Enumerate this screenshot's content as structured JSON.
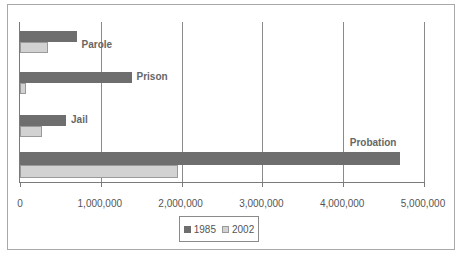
{
  "chart_data": {
    "type": "bar",
    "orientation": "horizontal",
    "title": "",
    "xlabel": "",
    "ylabel": "",
    "categories": [
      "Parole",
      "Prison",
      "Jail",
      "Probation"
    ],
    "series": [
      {
        "name": "1985",
        "color": "#6e6e6e",
        "values": [
          700000,
          1380000,
          570000,
          4700000
        ]
      },
      {
        "name": "2002",
        "color": "#d2d2d2",
        "values": [
          350000,
          70000,
          270000,
          1960000
        ]
      }
    ],
    "xlim": [
      0,
      5000000
    ],
    "x_ticks": [
      "0",
      "1,000,000",
      "2,000,000",
      "3,000,000",
      "4,000,000",
      "5,000,000"
    ],
    "grid": "vertical",
    "legend_position": "bottom-center"
  },
  "legend": {
    "items": [
      {
        "label": "1985",
        "color": "#6e6e6e"
      },
      {
        "label": "2002",
        "color": "#d2d2d2"
      }
    ]
  }
}
